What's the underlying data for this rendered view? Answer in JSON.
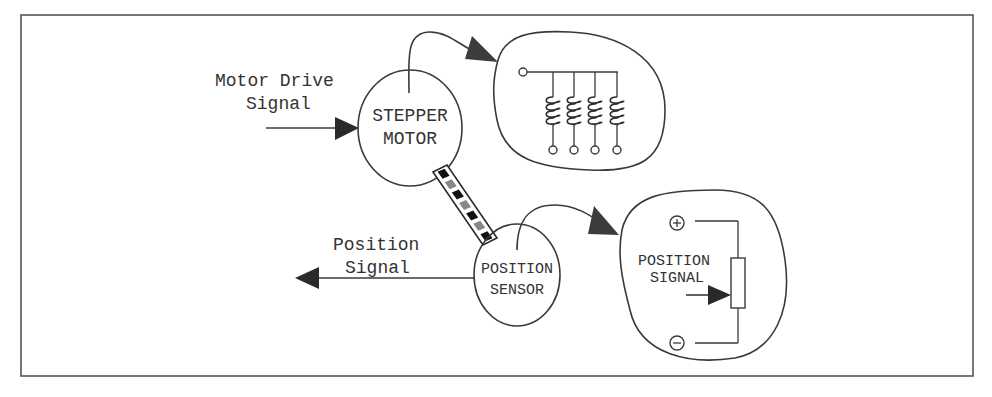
{
  "diagram": {
    "inputs": {
      "motor_drive": {
        "line1": "Motor Drive",
        "line2": "Signal"
      },
      "position_out": {
        "line1": "Position",
        "line2": "Signal"
      }
    },
    "nodes": {
      "stepper": {
        "line1": "STEPPER",
        "line2": "MOTOR"
      },
      "sensor": {
        "line1": "POSITION",
        "line2": "SENSOR"
      }
    },
    "callouts": {
      "coils": {
        "coil_count": 4,
        "description": "stepper motor windings"
      },
      "potentiometer": {
        "line1": "POSITION",
        "line2": "SIGNAL",
        "plus": "+",
        "minus": "−"
      }
    },
    "colors": {
      "ink": "#3a3a3a",
      "frame": "#555555",
      "background": "#ffffff"
    }
  }
}
